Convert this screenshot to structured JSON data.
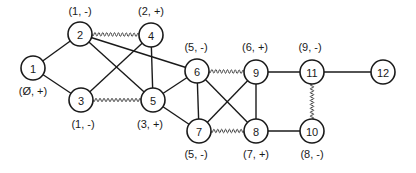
{
  "diagram": {
    "type": "graph",
    "nodes": [
      {
        "id": "1",
        "x": 33,
        "y": 68,
        "label": "(Ø, +)",
        "lx": 33,
        "ly": 95
      },
      {
        "id": "2",
        "x": 80,
        "y": 34,
        "label": "(1, -)",
        "lx": 80,
        "ly": 15
      },
      {
        "id": "3",
        "x": 81,
        "y": 100,
        "label": "(1, -)",
        "lx": 83,
        "ly": 128
      },
      {
        "id": "4",
        "x": 151,
        "y": 35,
        "label": "(2, +)",
        "lx": 151,
        "ly": 15
      },
      {
        "id": "5",
        "x": 153,
        "y": 100,
        "label": "(3, +)",
        "lx": 150,
        "ly": 128
      },
      {
        "id": "6",
        "x": 197,
        "y": 71,
        "label": "(5, -)",
        "lx": 196,
        "ly": 51
      },
      {
        "id": "7",
        "x": 199,
        "y": 131,
        "label": "(5, -)",
        "lx": 196,
        "ly": 158
      },
      {
        "id": "8",
        "x": 256,
        "y": 131,
        "label": "(7, +)",
        "lx": 256,
        "ly": 158
      },
      {
        "id": "9",
        "x": 256,
        "y": 72,
        "label": "(6, +)",
        "lx": 255,
        "ly": 51
      },
      {
        "id": "10",
        "x": 312,
        "y": 131,
        "label": "(8, -)",
        "lx": 312,
        "ly": 158
      },
      {
        "id": "11",
        "x": 312,
        "y": 72,
        "label": "(9, -)",
        "lx": 310,
        "ly": 51
      },
      {
        "id": "12",
        "x": 383,
        "y": 72,
        "label": "",
        "lx": 0,
        "ly": 0
      }
    ],
    "edges": [
      {
        "from": "1",
        "to": "2",
        "style": "solid"
      },
      {
        "from": "1",
        "to": "3",
        "style": "solid"
      },
      {
        "from": "2",
        "to": "4",
        "style": "wavy"
      },
      {
        "from": "2",
        "to": "5",
        "style": "solid"
      },
      {
        "from": "2",
        "to": "6",
        "style": "solid"
      },
      {
        "from": "3",
        "to": "4",
        "style": "solid"
      },
      {
        "from": "3",
        "to": "5",
        "style": "wavy"
      },
      {
        "from": "4",
        "to": "5",
        "style": "solid"
      },
      {
        "from": "5",
        "to": "6",
        "style": "solid"
      },
      {
        "from": "5",
        "to": "7",
        "style": "solid"
      },
      {
        "from": "6",
        "to": "7",
        "style": "solid"
      },
      {
        "from": "6",
        "to": "8",
        "style": "solid"
      },
      {
        "from": "6",
        "to": "9",
        "style": "wavy"
      },
      {
        "from": "7",
        "to": "9",
        "style": "solid"
      },
      {
        "from": "7",
        "to": "8",
        "style": "wavy"
      },
      {
        "from": "9",
        "to": "8",
        "style": "solid"
      },
      {
        "from": "9",
        "to": "11",
        "style": "solid"
      },
      {
        "from": "8",
        "to": "10",
        "style": "solid"
      },
      {
        "from": "11",
        "to": "10",
        "style": "wavy"
      },
      {
        "from": "11",
        "to": "12",
        "style": "solid"
      }
    ],
    "node_radius": 12
  }
}
